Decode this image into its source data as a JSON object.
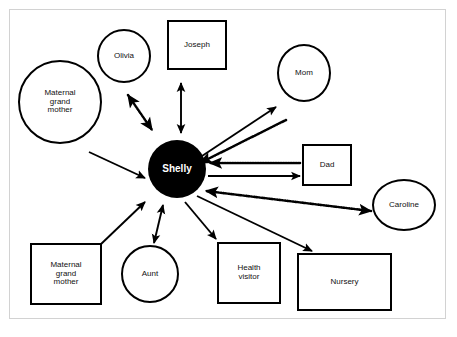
{
  "diagram": {
    "caption": "",
    "background_color": "#ffffff",
    "frame_border_color": "#d2d2d2",
    "line_color": "#000000",
    "center_fill": "#000000",
    "center_text_color": "#ffffff",
    "node_fill": "#ffffff",
    "node_border_color": "#000000",
    "nodes": [
      {
        "id": "shelly",
        "label": "Shelly",
        "shape": "circle",
        "role": "center",
        "x": 148,
        "y": 140,
        "w": 58,
        "h": 58,
        "font_size": 10
      },
      {
        "id": "maternal-grandmother-top",
        "label": "Maternal\ngrand\nmother",
        "shape": "circle",
        "role": "node",
        "x": 18,
        "y": 60,
        "w": 84,
        "h": 84,
        "font_size": 8
      },
      {
        "id": "olivia",
        "label": "Olivia",
        "shape": "circle",
        "role": "node",
        "x": 97,
        "y": 29,
        "w": 54,
        "h": 54,
        "font_size": 8
      },
      {
        "id": "joseph",
        "label": "Joseph",
        "shape": "box",
        "role": "node",
        "x": 167,
        "y": 20,
        "w": 60,
        "h": 50,
        "font_size": 8
      },
      {
        "id": "mom",
        "label": "Mom",
        "shape": "circle",
        "role": "node",
        "x": 277,
        "y": 44,
        "w": 54,
        "h": 58,
        "font_size": 8
      },
      {
        "id": "dad",
        "label": "Dad",
        "shape": "box",
        "role": "node",
        "x": 302,
        "y": 144,
        "w": 50,
        "h": 42,
        "font_size": 8
      },
      {
        "id": "caroline",
        "label": "Caroline",
        "shape": "circle",
        "role": "node",
        "x": 372,
        "y": 179,
        "w": 64,
        "h": 52,
        "font_size": 8
      },
      {
        "id": "maternal-grandmother-bottom",
        "label": "Maternal\ngrand\nmother",
        "shape": "box",
        "role": "node",
        "x": 30,
        "y": 243,
        "w": 72,
        "h": 62,
        "font_size": 8
      },
      {
        "id": "aunt",
        "label": "Aunt",
        "shape": "circle",
        "role": "node",
        "x": 121,
        "y": 245,
        "w": 58,
        "h": 58,
        "font_size": 8
      },
      {
        "id": "health-visitor",
        "label": "Health\nvisitor",
        "shape": "box",
        "role": "node",
        "x": 217,
        "y": 242,
        "w": 64,
        "h": 62,
        "font_size": 8
      },
      {
        "id": "nursery",
        "label": "Nursery",
        "shape": "box",
        "role": "node",
        "x": 297,
        "y": 253,
        "w": 95,
        "h": 58,
        "font_size": 8
      }
    ],
    "edges": [
      {
        "id": "edge-olivia-shelly",
        "from": "olivia",
        "to": "shelly",
        "style": "dotted",
        "heads": "both"
      },
      {
        "id": "edge-joseph-shelly",
        "from": "joseph",
        "to": "shelly",
        "style": "solid",
        "heads": "both"
      },
      {
        "id": "edge-grandmother-shelly",
        "from": "maternal-grandmother-top",
        "to": "shelly",
        "style": "solid",
        "heads": "to"
      },
      {
        "id": "edge-shelly-mom",
        "from": "shelly",
        "to": "mom",
        "style": "solid",
        "heads": "to"
      },
      {
        "id": "edge-mom-shelly",
        "from": "mom",
        "to": "shelly",
        "style": "dotted",
        "heads": "to"
      },
      {
        "id": "edge-dad-shelly",
        "from": "dad",
        "to": "shelly",
        "style": "dotted",
        "heads": "to"
      },
      {
        "id": "edge-shelly-dad",
        "from": "shelly",
        "to": "dad",
        "style": "solid",
        "heads": "to"
      },
      {
        "id": "edge-caroline-shelly",
        "from": "caroline",
        "to": "shelly",
        "style": "dotted",
        "heads": "both"
      },
      {
        "id": "edge-shelly-nursery",
        "from": "shelly",
        "to": "nursery",
        "style": "solid",
        "heads": "to"
      },
      {
        "id": "edge-shelly-healthvisitor",
        "from": "shelly",
        "to": "health-visitor",
        "style": "solid",
        "heads": "to"
      },
      {
        "id": "edge-aunt-shelly",
        "from": "aunt",
        "to": "shelly",
        "style": "solid",
        "heads": "both"
      },
      {
        "id": "edge-grandmotherbox-shelly",
        "from": "maternal-grandmother-bottom",
        "to": "shelly",
        "style": "solid",
        "heads": "to"
      }
    ],
    "edge_geometry": {
      "edge-olivia-shelly": {
        "x1": 128,
        "y1": 95,
        "x2": 152,
        "y2": 130
      },
      "edge-joseph-shelly": {
        "x1": 181,
        "y1": 83,
        "x2": 181,
        "y2": 133
      },
      "edge-grandmother-shelly": {
        "x1": 89,
        "y1": 152,
        "x2": 145,
        "y2": 178
      },
      "edge-shelly-mom": {
        "x1": 199,
        "y1": 158,
        "x2": 276,
        "y2": 107
      },
      "edge-mom-shelly": {
        "x1": 286,
        "y1": 120,
        "x2": 200,
        "y2": 163
      },
      "edge-dad-shelly": {
        "x1": 300,
        "y1": 163,
        "x2": 210,
        "y2": 163
      },
      "edge-shelly-dad": {
        "x1": 208,
        "y1": 176,
        "x2": 300,
        "y2": 176
      },
      "edge-caroline-shelly": {
        "x1": 371,
        "y1": 211,
        "x2": 206,
        "y2": 191
      },
      "edge-shelly-nursery": {
        "x1": 197,
        "y1": 196,
        "x2": 312,
        "y2": 251
      },
      "edge-shelly-healthvisitor": {
        "x1": 185,
        "y1": 202,
        "x2": 216,
        "y2": 239
      },
      "edge-aunt-shelly": {
        "x1": 154,
        "y1": 243,
        "x2": 163,
        "y2": 205
      },
      "edge-grandmotherbox-shelly": {
        "x1": 100,
        "y1": 245,
        "x2": 145,
        "y2": 202
      }
    }
  }
}
